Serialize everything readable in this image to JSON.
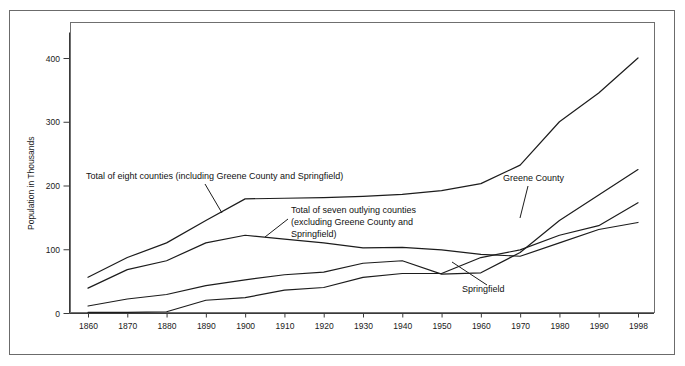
{
  "chart_data": {
    "type": "line",
    "title": "",
    "subtitle": "",
    "xlabel": "",
    "ylabel": "Population in Thousands",
    "xlim": [
      1855,
      2001
    ],
    "ylim": [
      0,
      440
    ],
    "yticks": [
      0,
      100,
      200,
      300,
      400
    ],
    "ytick_labels": [
      "0",
      "100",
      "200",
      "300",
      "400"
    ],
    "xticks": [
      1860,
      1870,
      1880,
      1890,
      1900,
      1910,
      1920,
      1930,
      1940,
      1950,
      1960,
      1970,
      1980,
      1990,
      1998
    ],
    "xtick_labels": [
      "1860",
      "1870",
      "1880",
      "1890",
      "1900",
      "1910",
      "1920",
      "1930",
      "1940",
      "1950",
      "1960",
      "1970",
      "1980",
      "1990",
      "1998"
    ],
    "grid": false,
    "legend_position": "inline-annotations",
    "line_color": "#1c1c1c",
    "x": [
      1860,
      1870,
      1880,
      1890,
      1900,
      1910,
      1920,
      1930,
      1940,
      1950,
      1960,
      1970,
      1980,
      1990,
      1998
    ],
    "series": [
      {
        "name": "Total of eight counties (including Greene County and Springfield)",
        "short_name": "total-eight-counties",
        "values": [
          56,
          87,
          110,
          145,
          179,
          180,
          181,
          183,
          186,
          192,
          203,
          232,
          300,
          345,
          400
        ]
      },
      {
        "name": "Total of seven outlying counties (excluding Greene County and Springfield)",
        "short_name": "total-seven-outlying-counties",
        "values": [
          39,
          68,
          82,
          110,
          122,
          116,
          110,
          102,
          103,
          99,
          92,
          89,
          110,
          131,
          142
        ]
      },
      {
        "name": "Greene County",
        "short_name": "greene-county",
        "values": [
          11,
          22,
          29,
          43,
          52,
          60,
          64,
          78,
          82,
          61,
          63,
          95,
          145,
          185,
          225
        ]
      },
      {
        "name": "Springfield",
        "short_name": "springfield",
        "values": [
          1,
          1,
          2,
          20,
          24,
          36,
          40,
          56,
          62,
          62,
          87,
          99,
          122,
          137,
          173
        ]
      }
    ],
    "annotations": [
      {
        "id": "ann-total-eight",
        "lines": [
          "Total of eight counties (including Greene County and Springfield)"
        ],
        "text_x": 86,
        "text_y": 179,
        "leader": [
          [
            205,
            184
          ],
          [
            222,
            213
          ]
        ]
      },
      {
        "id": "ann-total-seven",
        "lines": [
          "Total of seven outlying counties",
          "(excluding Greene County and",
          "Springfield)"
        ],
        "text_x": 291,
        "text_y": 213,
        "leader": [
          [
            288,
            219
          ],
          [
            265,
            237
          ]
        ]
      },
      {
        "id": "ann-greene-county",
        "lines": [
          "Greene County"
        ],
        "text_x": 503,
        "text_y": 181,
        "leader": [
          [
            528,
            186
          ],
          [
            520,
            218
          ]
        ]
      },
      {
        "id": "ann-springfield",
        "lines": [
          "Springfield"
        ],
        "text_x": 462,
        "text_y": 292,
        "leader": [
          [
            487,
            285
          ],
          [
            452,
            262
          ]
        ]
      }
    ]
  },
  "figure": {
    "plot_left": 70,
    "plot_top": 22,
    "plot_right": 655,
    "plot_bottom": 313,
    "data_left": 88,
    "data_right": 638,
    "y_zero_px": 313,
    "y_400_px": 58
  }
}
